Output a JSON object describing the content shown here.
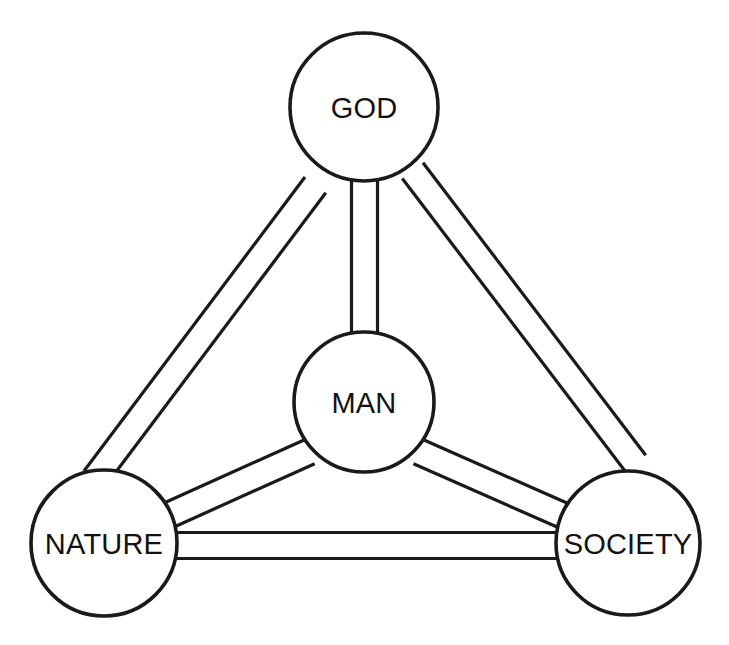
{
  "diagram": {
    "type": "node-link diagram",
    "background_color": "#ffffff",
    "line_color": "#1a1a1a",
    "text_color": "#121212",
    "nodes": [
      {
        "id": "god",
        "label": "GOD",
        "cx": 364,
        "cy": 107,
        "r": 74
      },
      {
        "id": "man",
        "label": "MAN",
        "cx": 364,
        "cy": 402,
        "r": 70
      },
      {
        "id": "nature",
        "label": "NATURE",
        "cx": 104,
        "cy": 543,
        "r": 73
      },
      {
        "id": "society",
        "label": "SOCIETY",
        "cx": 628,
        "cy": 543,
        "r": 72
      }
    ],
    "edges": [
      {
        "id": "god-man",
        "from": "god",
        "to": "man",
        "style": "double-line"
      },
      {
        "id": "god-nature",
        "from": "god",
        "to": "nature",
        "style": "double-line"
      },
      {
        "id": "god-society",
        "from": "god",
        "to": "society",
        "style": "double-line"
      },
      {
        "id": "man-nature",
        "from": "man",
        "to": "nature",
        "style": "double-line"
      },
      {
        "id": "man-society",
        "from": "man",
        "to": "society",
        "style": "double-line"
      },
      {
        "id": "nature-society",
        "from": "nature",
        "to": "society",
        "style": "double-line"
      }
    ],
    "edge_band_width": 26
  }
}
